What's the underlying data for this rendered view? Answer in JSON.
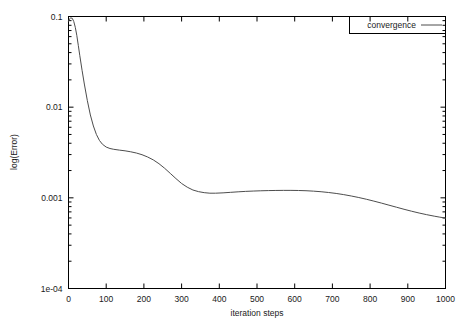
{
  "chart_data": {
    "type": "line",
    "title": "",
    "xlabel": "iteration steps",
    "ylabel": "log(Error)",
    "xlim": [
      0,
      1000
    ],
    "ylim": [
      0.0001,
      0.1
    ],
    "yscale": "log",
    "xscale": "linear",
    "grid": false,
    "legend_position": "top-right",
    "xticks": [
      "0",
      "100",
      "200",
      "300",
      "400",
      "500",
      "600",
      "700",
      "800",
      "900",
      "1000"
    ],
    "xtick_values": [
      0,
      100,
      200,
      300,
      400,
      500,
      600,
      700,
      800,
      900,
      1000
    ],
    "yticks": [
      "1e-04",
      "0.001",
      "0.01",
      "0.1"
    ],
    "ytick_values": [
      0.0001,
      0.001,
      0.01,
      0.1
    ],
    "series": [
      {
        "name": "convergence",
        "color": "#4d4d4d",
        "x": [
          0,
          3,
          6,
          10,
          14,
          18,
          22,
          26,
          30,
          36,
          42,
          50,
          58,
          66,
          74,
          82,
          90,
          100,
          110,
          120,
          135,
          150,
          165,
          180,
          195,
          210,
          225,
          240,
          255,
          270,
          285,
          300,
          315,
          330,
          345,
          360,
          375,
          390,
          410,
          430,
          450,
          470,
          490,
          510,
          530,
          550,
          570,
          590,
          610,
          630,
          650,
          670,
          690,
          710,
          730,
          750,
          770,
          790,
          810,
          830,
          850,
          870,
          890,
          910,
          930,
          950,
          970,
          985,
          1000
        ],
        "y": [
          0.0885,
          0.0945,
          0.0965,
          0.0955,
          0.088,
          0.076,
          0.062,
          0.048,
          0.037,
          0.0255,
          0.018,
          0.0118,
          0.0082,
          0.0062,
          0.005,
          0.0043,
          0.0039,
          0.00363,
          0.0035,
          0.00343,
          0.00336,
          0.0033,
          0.00322,
          0.00312,
          0.00299,
          0.00282,
          0.00262,
          0.00238,
          0.00212,
          0.00186,
          0.00163,
          0.00144,
          0.00131,
          0.00122,
          0.00117,
          0.00114,
          0.001125,
          0.001125,
          0.001135,
          0.00115,
          0.001165,
          0.001178,
          0.001188,
          0.001196,
          0.001202,
          0.001206,
          0.001208,
          0.001208,
          0.001205,
          0.001198,
          0.001185,
          0.001168,
          0.001145,
          0.001118,
          0.001085,
          0.001048,
          0.001008,
          0.000965,
          0.00092,
          0.000875,
          0.00083,
          0.000788,
          0.000748,
          0.000712,
          0.00068,
          0.000652,
          0.000628,
          0.000612,
          0.000598
        ]
      }
    ]
  },
  "legend": {
    "entries": [
      {
        "label": "convergence"
      }
    ]
  },
  "axes": {
    "x_title": "iteration steps",
    "y_title": "log(Error)"
  }
}
